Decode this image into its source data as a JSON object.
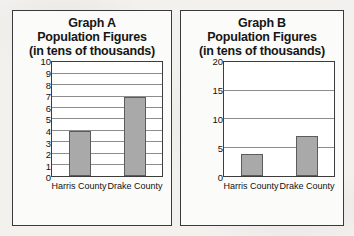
{
  "background_color": "#f2f1ee",
  "panels": [
    {
      "id": "graph-a",
      "title_line_1": "Graph A",
      "title_line_2": "Population Figures",
      "title_line_3": "(in tens of thousands)"
    },
    {
      "id": "graph-b",
      "title_line_1": "Graph B",
      "title_line_2": "Population Figures",
      "title_line_3": "(in tens of thousands)"
    }
  ],
  "chart_data": [
    {
      "type": "bar",
      "title": "Graph A Population Figures (in tens of thousands)",
      "xlabel": "",
      "ylabel": "",
      "categories": [
        "Harris County",
        "Drake County"
      ],
      "values": [
        4,
        7
      ],
      "ylim": [
        0,
        10
      ],
      "ytick_step": 1,
      "yticks": [
        0,
        1,
        2,
        3,
        4,
        5,
        6,
        7,
        8,
        9,
        10
      ],
      "ytick_labels": [
        "0",
        "1",
        "2",
        "3",
        "4",
        "5",
        "6",
        "7",
        "8",
        "9",
        "10"
      ],
      "grid": true,
      "legend": "none",
      "bar_color": "#a9a9a9",
      "bar_border_color": "#5c5c5c"
    },
    {
      "type": "bar",
      "title": "Graph B Population Figures (in tens of thousands)",
      "xlabel": "",
      "ylabel": "",
      "categories": [
        "Harris County",
        "Drake County"
      ],
      "values": [
        4,
        7
      ],
      "ylim": [
        0,
        20
      ],
      "ytick_step": 5,
      "yticks": [
        0,
        5,
        10,
        15,
        20
      ],
      "ytick_labels": [
        "0",
        "5",
        "10",
        "15",
        "20"
      ],
      "grid": true,
      "legend": "none",
      "bar_color": "#a9a9a9",
      "bar_border_color": "#5c5c5c"
    }
  ]
}
